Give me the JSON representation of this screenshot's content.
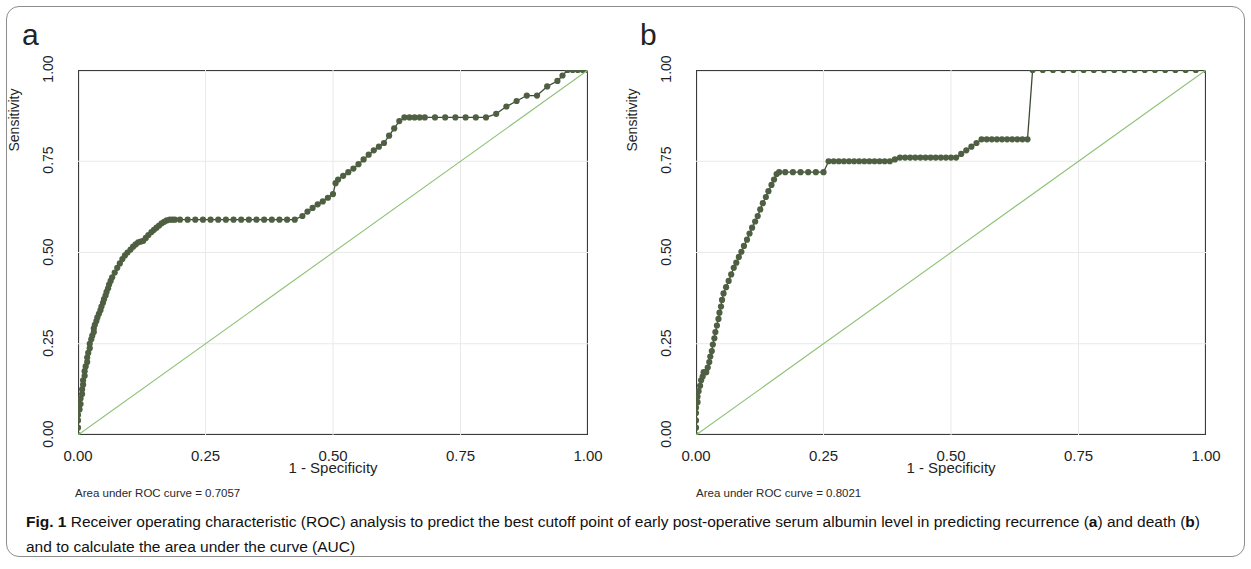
{
  "figure": {
    "caption_label": "Fig. 1",
    "caption_text_1": " Receiver operating characteristic (ROC) analysis to predict the best cutoff point of early post-operative serum albumin level in predicting recurrence (",
    "caption_letter_a": "a",
    "caption_text_2": ") and death (",
    "caption_letter_b": "b",
    "caption_text_3": ") and to calculate the area under the curve (AUC)"
  },
  "colors": {
    "roc_marker": "#4e5f42",
    "roc_line": "#3c4a33",
    "reference_line": "#8fc278",
    "axis": "#3a3a3a",
    "grid": "#e9e9e9",
    "frame": "#8d8d8d"
  },
  "panels": [
    {
      "letter": "a",
      "ylabel": "Sensitivity",
      "xlabel": "1 - Specificity",
      "xticks": [
        "0.00",
        "0.25",
        "0.50",
        "0.75",
        "1.00"
      ],
      "yticks": [
        "0.00",
        "0.25",
        "0.50",
        "0.75",
        "1.00"
      ],
      "auc_text": "Area under ROC curve = 0.7057"
    },
    {
      "letter": "b",
      "ylabel": "Sensitivity",
      "xlabel": "1 - Specificity",
      "xticks": [
        "0.00",
        "0.25",
        "0.50",
        "0.75",
        "1.00"
      ],
      "yticks": [
        "0.00",
        "0.25",
        "0.50",
        "0.75",
        "1.00"
      ],
      "auc_text": "Area under ROC curve = 0.8021"
    }
  ],
  "chart_data": [
    {
      "type": "line",
      "title": "a",
      "subtitle": "ROC curve for recurrence",
      "xlabel": "1 - Specificity",
      "ylabel": "Sensitivity",
      "xlim": [
        0,
        1
      ],
      "ylim": [
        0,
        1
      ],
      "grid": false,
      "legend": "none",
      "auc": 0.7057,
      "auc_label": "Area under ROC curve = 0.7057",
      "series": [
        {
          "name": "ROC curve (recurrence)",
          "marker": "filled-circle",
          "x": [
            0.0,
            0.0,
            0.0,
            0.0,
            0.003,
            0.005,
            0.005,
            0.008,
            0.008,
            0.01,
            0.01,
            0.013,
            0.013,
            0.015,
            0.018,
            0.018,
            0.02,
            0.023,
            0.023,
            0.026,
            0.028,
            0.031,
            0.031,
            0.033,
            0.036,
            0.038,
            0.041,
            0.044,
            0.046,
            0.049,
            0.051,
            0.054,
            0.056,
            0.059,
            0.061,
            0.064,
            0.067,
            0.072,
            0.077,
            0.082,
            0.087,
            0.092,
            0.097,
            0.103,
            0.108,
            0.113,
            0.118,
            0.123,
            0.128,
            0.133,
            0.138,
            0.144,
            0.149,
            0.154,
            0.159,
            0.164,
            0.169,
            0.174,
            0.18,
            0.185,
            0.19,
            0.2,
            0.215,
            0.23,
            0.245,
            0.26,
            0.275,
            0.29,
            0.305,
            0.32,
            0.335,
            0.35,
            0.365,
            0.38,
            0.395,
            0.41,
            0.425,
            0.44,
            0.45,
            0.46,
            0.47,
            0.48,
            0.49,
            0.5,
            0.505,
            0.51,
            0.52,
            0.53,
            0.54,
            0.55,
            0.56,
            0.57,
            0.58,
            0.59,
            0.6,
            0.61,
            0.62,
            0.63,
            0.64,
            0.65,
            0.66,
            0.67,
            0.68,
            0.7,
            0.72,
            0.74,
            0.76,
            0.78,
            0.8,
            0.82,
            0.84,
            0.86,
            0.88,
            0.9,
            0.92,
            0.94,
            0.95,
            0.96,
            0.97,
            0.98,
            0.99,
            1.0
          ],
          "y": [
            0.0,
            0.02,
            0.04,
            0.055,
            0.07,
            0.085,
            0.1,
            0.112,
            0.125,
            0.138,
            0.15,
            0.162,
            0.175,
            0.188,
            0.2,
            0.212,
            0.225,
            0.238,
            0.25,
            0.262,
            0.272,
            0.282,
            0.292,
            0.302,
            0.312,
            0.322,
            0.332,
            0.342,
            0.352,
            0.362,
            0.372,
            0.382,
            0.392,
            0.402,
            0.412,
            0.422,
            0.432,
            0.445,
            0.458,
            0.47,
            0.482,
            0.492,
            0.5,
            0.508,
            0.516,
            0.522,
            0.528,
            0.53,
            0.532,
            0.54,
            0.548,
            0.556,
            0.562,
            0.568,
            0.574,
            0.58,
            0.584,
            0.588,
            0.59,
            0.59,
            0.59,
            0.59,
            0.59,
            0.59,
            0.59,
            0.59,
            0.59,
            0.59,
            0.59,
            0.59,
            0.59,
            0.59,
            0.59,
            0.59,
            0.59,
            0.59,
            0.59,
            0.6,
            0.612,
            0.622,
            0.632,
            0.64,
            0.65,
            0.66,
            0.69,
            0.7,
            0.71,
            0.72,
            0.73,
            0.742,
            0.755,
            0.768,
            0.78,
            0.79,
            0.8,
            0.82,
            0.84,
            0.86,
            0.87,
            0.87,
            0.87,
            0.87,
            0.87,
            0.87,
            0.87,
            0.87,
            0.87,
            0.87,
            0.87,
            0.88,
            0.9,
            0.915,
            0.93,
            0.93,
            0.955,
            0.97,
            0.985,
            1.0,
            1.0,
            1.0,
            1.0,
            1.0
          ]
        },
        {
          "name": "Reference line (chance)",
          "marker": "none",
          "x": [
            0.0,
            1.0
          ],
          "y": [
            0.0,
            1.0
          ]
        }
      ]
    },
    {
      "type": "line",
      "title": "b",
      "subtitle": "ROC curve for death",
      "xlabel": "1 - Specificity",
      "ylabel": "Sensitivity",
      "xlim": [
        0,
        1
      ],
      "ylim": [
        0,
        1
      ],
      "grid": false,
      "legend": "none",
      "auc": 0.8021,
      "auc_label": "Area under ROC curve = 0.8021",
      "series": [
        {
          "name": "ROC curve (death)",
          "marker": "filled-circle",
          "x": [
            0.0,
            0.0,
            0.0,
            0.0,
            0.0,
            0.003,
            0.003,
            0.005,
            0.008,
            0.01,
            0.013,
            0.015,
            0.018,
            0.02,
            0.023,
            0.026,
            0.028,
            0.031,
            0.033,
            0.036,
            0.038,
            0.041,
            0.044,
            0.046,
            0.049,
            0.051,
            0.054,
            0.059,
            0.064,
            0.069,
            0.074,
            0.079,
            0.084,
            0.089,
            0.094,
            0.1,
            0.105,
            0.11,
            0.116,
            0.121,
            0.126,
            0.131,
            0.137,
            0.142,
            0.148,
            0.153,
            0.158,
            0.163,
            0.175,
            0.19,
            0.205,
            0.22,
            0.235,
            0.25,
            0.26,
            0.27,
            0.28,
            0.29,
            0.3,
            0.31,
            0.32,
            0.33,
            0.34,
            0.35,
            0.36,
            0.37,
            0.38,
            0.39,
            0.4,
            0.41,
            0.42,
            0.43,
            0.44,
            0.45,
            0.46,
            0.47,
            0.48,
            0.49,
            0.5,
            0.51,
            0.52,
            0.53,
            0.54,
            0.55,
            0.56,
            0.57,
            0.58,
            0.59,
            0.6,
            0.61,
            0.62,
            0.63,
            0.64,
            0.65,
            0.66,
            0.68,
            0.7,
            0.72,
            0.74,
            0.76,
            0.78,
            0.8,
            0.82,
            0.84,
            0.86,
            0.88,
            0.9,
            0.92,
            0.94,
            0.96,
            0.98,
            1.0
          ],
          "y": [
            0.0,
            0.02,
            0.04,
            0.06,
            0.075,
            0.09,
            0.105,
            0.12,
            0.135,
            0.15,
            0.16,
            0.172,
            0.172,
            0.172,
            0.185,
            0.2,
            0.215,
            0.23,
            0.248,
            0.265,
            0.282,
            0.3,
            0.318,
            0.335,
            0.352,
            0.37,
            0.388,
            0.405,
            0.422,
            0.44,
            0.458,
            0.472,
            0.488,
            0.502,
            0.518,
            0.535,
            0.552,
            0.568,
            0.585,
            0.6,
            0.618,
            0.635,
            0.652,
            0.668,
            0.685,
            0.7,
            0.715,
            0.72,
            0.72,
            0.72,
            0.72,
            0.72,
            0.72,
            0.72,
            0.75,
            0.75,
            0.75,
            0.75,
            0.75,
            0.75,
            0.75,
            0.75,
            0.75,
            0.75,
            0.75,
            0.75,
            0.75,
            0.755,
            0.76,
            0.76,
            0.76,
            0.76,
            0.76,
            0.76,
            0.76,
            0.76,
            0.76,
            0.76,
            0.76,
            0.76,
            0.77,
            0.78,
            0.79,
            0.8,
            0.81,
            0.81,
            0.81,
            0.81,
            0.81,
            0.81,
            0.81,
            0.81,
            0.81,
            0.81,
            1.0,
            1.0,
            1.0,
            1.0,
            1.0,
            1.0,
            1.0,
            1.0,
            1.0,
            1.0,
            1.0,
            1.0,
            1.0,
            1.0,
            1.0,
            1.0,
            1.0,
            1.0
          ]
        },
        {
          "name": "Reference line (chance)",
          "marker": "none",
          "x": [
            0.0,
            1.0
          ],
          "y": [
            0.0,
            1.0
          ]
        }
      ]
    }
  ]
}
